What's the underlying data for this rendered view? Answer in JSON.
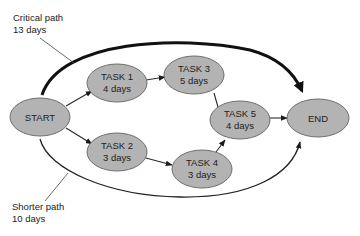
{
  "diagram": {
    "type": "critical-path-network",
    "colors": {
      "node_fill": "#b3b3b3",
      "node_stroke": "#6e6e6e",
      "text": "#222222",
      "arrow": "#2a2a2a"
    },
    "nodes": {
      "start": {
        "label": "START"
      },
      "task1": {
        "label": "TASK 1",
        "duration": "4 days"
      },
      "task2": {
        "label": "TASK 2",
        "duration": "3 days"
      },
      "task3": {
        "label": "TASK 3",
        "duration": "5 days"
      },
      "task4": {
        "label": "TASK 4",
        "duration": "3 days"
      },
      "task5": {
        "label": "TASK 5",
        "duration": "4 days"
      },
      "end": {
        "label": "END"
      }
    },
    "edges": [
      {
        "from": "START",
        "to": "TASK 1"
      },
      {
        "from": "START",
        "to": "TASK 2"
      },
      {
        "from": "TASK 1",
        "to": "TASK 3"
      },
      {
        "from": "TASK 2",
        "to": "TASK 4"
      },
      {
        "from": "TASK 3",
        "to": "TASK 5"
      },
      {
        "from": "TASK 4",
        "to": "TASK 5"
      },
      {
        "from": "TASK 5",
        "to": "END"
      }
    ],
    "annotations": {
      "critical": {
        "line1": "Critical path",
        "line2": "13 days"
      },
      "shorter": {
        "line1": "Shorter path",
        "line2": "10 days"
      }
    }
  }
}
